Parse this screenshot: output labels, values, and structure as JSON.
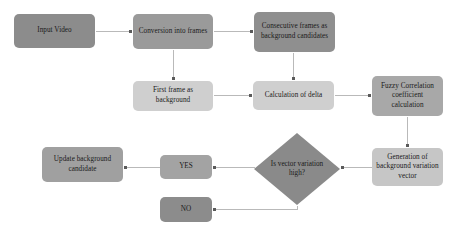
{
  "diagram": {
    "type": "flowchart",
    "background_color": "#ffffff",
    "edge_color": "#b9b9b9",
    "arrow_color": "#5a5a5a",
    "nodes": [
      {
        "id": "input-video",
        "label": "Input Video",
        "shape": "rounded-rect",
        "fill": "#8c8c8c",
        "x": 14,
        "y": 14,
        "w": 81,
        "h": 34
      },
      {
        "id": "conversion-into-frames",
        "label": "Conversion into frames",
        "shape": "rounded-rect",
        "fill": "#9a9a9a",
        "x": 133,
        "y": 14,
        "w": 80,
        "h": 35
      },
      {
        "id": "consecutive-frames",
        "label": "Consecutive frames as background candidates",
        "shape": "rounded-rect",
        "fill": "#8f8f8f",
        "x": 254,
        "y": 12,
        "w": 81,
        "h": 40
      },
      {
        "id": "first-frame-background",
        "label": "First frame as background",
        "shape": "rounded-rect",
        "fill": "#cfcfcf",
        "x": 133,
        "y": 81,
        "w": 80,
        "h": 30
      },
      {
        "id": "calculation-of-delta",
        "label": "Calculation of delta",
        "shape": "rounded-rect",
        "fill": "#cfcfcf",
        "x": 253,
        "y": 81,
        "w": 81,
        "h": 29
      },
      {
        "id": "fuzzy-correlation",
        "label": "Fuzzy Correlation coefficient calculation",
        "shape": "rounded-rect",
        "fill": "#a8a8a8",
        "x": 372,
        "y": 76,
        "w": 71,
        "h": 40
      },
      {
        "id": "generation-variation-vector",
        "label": "Generation of background variation vector",
        "shape": "rounded-rect",
        "fill": "#c6c6c6",
        "x": 372,
        "y": 148,
        "w": 71,
        "h": 38
      },
      {
        "id": "is-vector-variation-high",
        "label": "Is vector variation high?",
        "shape": "diamond",
        "fill": "#8a8a8a",
        "x": 254,
        "y": 133,
        "w": 86,
        "h": 72
      },
      {
        "id": "yes-branch",
        "label": "YES",
        "shape": "rounded-rect",
        "fill": "#a3a3a3",
        "x": 160,
        "y": 155,
        "w": 52,
        "h": 24
      },
      {
        "id": "no-branch",
        "label": "NO",
        "shape": "rounded-rect",
        "fill": "#8c8c8c",
        "x": 160,
        "y": 197,
        "w": 52,
        "h": 25
      },
      {
        "id": "update-background-candidate",
        "label": "Update background candidate",
        "shape": "rounded-rect",
        "fill": "#a0a0a0",
        "x": 42,
        "y": 147,
        "w": 81,
        "h": 35
      }
    ],
    "edges": [
      {
        "id": "e1",
        "from": "input-video",
        "to": "conversion-into-frames"
      },
      {
        "id": "e2",
        "from": "conversion-into-frames",
        "to": "consecutive-frames"
      },
      {
        "id": "e3",
        "from": "conversion-into-frames",
        "to": "first-frame-background"
      },
      {
        "id": "e4",
        "from": "consecutive-frames",
        "to": "calculation-of-delta"
      },
      {
        "id": "e5",
        "from": "first-frame-background",
        "to": "calculation-of-delta"
      },
      {
        "id": "e6",
        "from": "calculation-of-delta",
        "to": "fuzzy-correlation"
      },
      {
        "id": "e7",
        "from": "fuzzy-correlation",
        "to": "generation-variation-vector"
      },
      {
        "id": "e8",
        "from": "generation-variation-vector",
        "to": "is-vector-variation-high"
      },
      {
        "id": "e9",
        "from": "is-vector-variation-high",
        "to": "yes-branch"
      },
      {
        "id": "e10",
        "from": "is-vector-variation-high",
        "to": "no-branch"
      },
      {
        "id": "e11",
        "from": "yes-branch",
        "to": "update-background-candidate"
      }
    ]
  }
}
